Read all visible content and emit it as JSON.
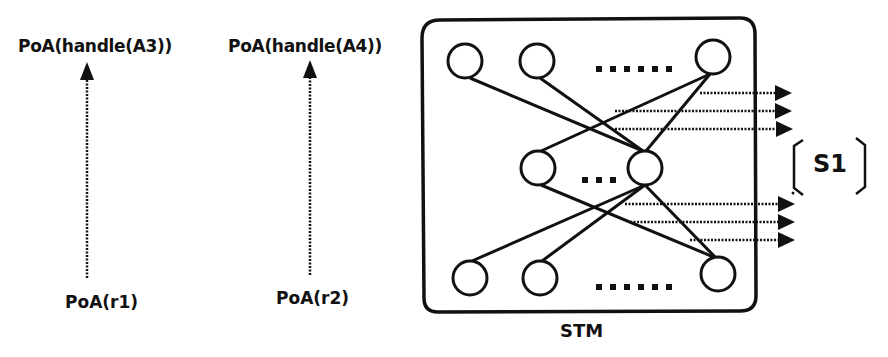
{
  "diagram": {
    "labels": {
      "top_left": "PoA(handle(A3))",
      "top_right": "PoA(handle(A4))",
      "bottom_left": "PoA(r1)",
      "bottom_right": "PoA(r2)",
      "box": "STM",
      "bracket": "S1"
    },
    "ellipsis": {
      "top_row": "......",
      "middle_row": "...",
      "bottom_row": "......"
    },
    "colors": {
      "stroke": "#111111",
      "background": "#ffffff"
    },
    "nodes": {
      "top_row": [
        {
          "id": "t1",
          "cx": 465,
          "cy": 61
        },
        {
          "id": "t2",
          "cx": 537,
          "cy": 61
        },
        {
          "id": "t3",
          "cx": 713,
          "cy": 57
        }
      ],
      "middle_row": [
        {
          "id": "m1",
          "cx": 538,
          "cy": 168
        },
        {
          "id": "m2",
          "cx": 645,
          "cy": 168
        }
      ],
      "bottom_row": [
        {
          "id": "b1",
          "cx": 470,
          "cy": 278
        },
        {
          "id": "b2",
          "cx": 540,
          "cy": 278
        },
        {
          "id": "b3",
          "cx": 718,
          "cy": 274
        }
      ]
    },
    "edges": [
      [
        "t1",
        "m2"
      ],
      [
        "t2",
        "m2"
      ],
      [
        "t3",
        "m1"
      ],
      [
        "t3",
        "m2"
      ],
      [
        "m1",
        "b3"
      ],
      [
        "m2",
        "b1"
      ],
      [
        "m2",
        "b2"
      ],
      [
        "m2",
        "b3"
      ]
    ],
    "output_arrows_group_1": 3,
    "output_arrows_group_2": 3
  }
}
